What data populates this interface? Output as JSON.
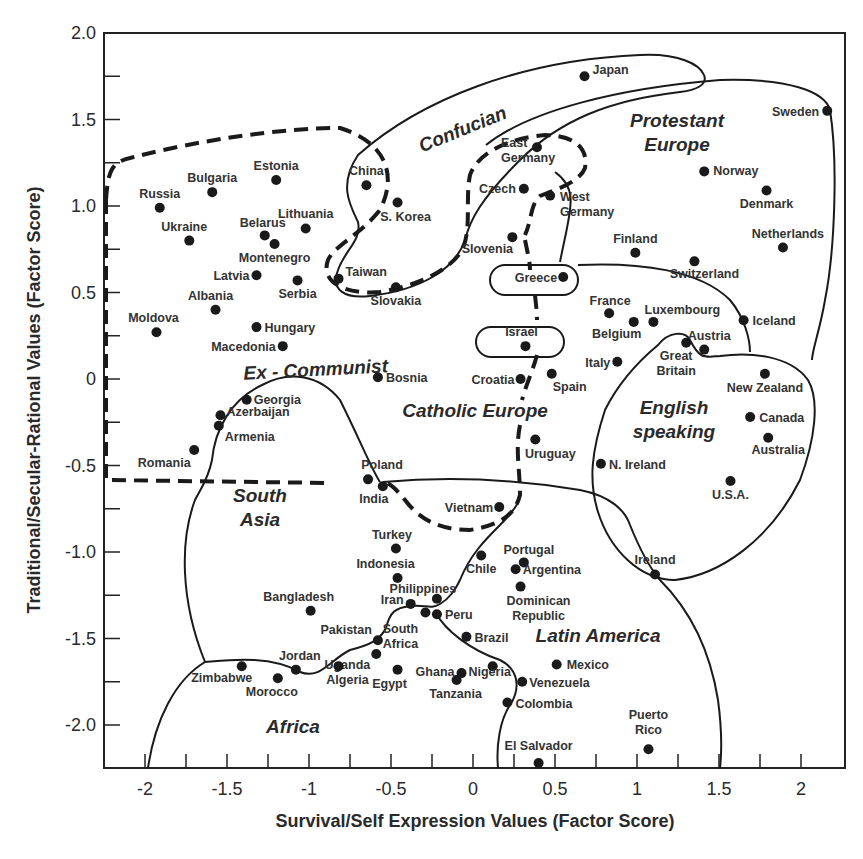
{
  "chart_data": {
    "type": "scatter",
    "title": "",
    "xlabel": "Survival/Self Expression Values (Factor Score)",
    "ylabel": "Traditional/Secular-Rational Values (Factor Score)",
    "xlim": [
      -2.25,
      2.27
    ],
    "ylim": [
      -2.25,
      2.0
    ],
    "x_ticks": [
      "-2",
      "-1.5",
      "-1",
      "-0.5",
      "0",
      "0.5",
      "1",
      "1.5",
      "2"
    ],
    "x_tick_values": [
      -2,
      -1.5,
      -1,
      -0.5,
      0,
      0.5,
      1,
      1.5,
      2
    ],
    "y_ticks": [
      "2.0",
      "1.5",
      "1.0",
      "0.5",
      "0",
      "-0.5",
      "-1.0",
      "-1.5",
      "-2.0"
    ],
    "y_tick_values": [
      2.0,
      1.5,
      1.0,
      0.5,
      0,
      -0.5,
      -1.0,
      -1.5,
      -2.0
    ],
    "grid": false,
    "legend": null,
    "regions": [
      {
        "label": "Confucian",
        "style": "solid"
      },
      {
        "label": "Protestant Europe",
        "style": "solid"
      },
      {
        "label": "Ex - Communist",
        "style": "dashed"
      },
      {
        "label": "Catholic Europe",
        "style": "dashed"
      },
      {
        "label": "English speaking",
        "style": "solid"
      },
      {
        "label": "South Asia",
        "style": "solid"
      },
      {
        "label": "Latin America",
        "style": "solid"
      },
      {
        "label": "Africa",
        "style": "solid"
      }
    ],
    "points": [
      {
        "name": "Japan",
        "x": 0.68,
        "y": 1.75
      },
      {
        "name": "Sweden",
        "x": 2.16,
        "y": 1.55
      },
      {
        "name": "East Germany",
        "x": 0.39,
        "y": 1.34
      },
      {
        "name": "Norway",
        "x": 1.41,
        "y": 1.2
      },
      {
        "name": "Denmark",
        "x": 1.79,
        "y": 1.09
      },
      {
        "name": "Czech",
        "x": 0.31,
        "y": 1.1
      },
      {
        "name": "West Germany",
        "x": 0.47,
        "y": 1.06
      },
      {
        "name": "China",
        "x": -0.65,
        "y": 1.12
      },
      {
        "name": "S. Korea",
        "x": -0.46,
        "y": 1.02
      },
      {
        "name": "Estonia",
        "x": -1.2,
        "y": 1.15
      },
      {
        "name": "Bulgaria",
        "x": -1.59,
        "y": 1.08
      },
      {
        "name": "Russia",
        "x": -1.91,
        "y": 0.99
      },
      {
        "name": "Ukraine",
        "x": -1.73,
        "y": 0.8
      },
      {
        "name": "Belarus",
        "x": -1.27,
        "y": 0.83
      },
      {
        "name": "Lithuania",
        "x": -1.02,
        "y": 0.87
      },
      {
        "name": "Montenegro",
        "x": -1.21,
        "y": 0.78
      },
      {
        "name": "Latvia",
        "x": -1.32,
        "y": 0.6
      },
      {
        "name": "Serbia",
        "x": -1.07,
        "y": 0.57
      },
      {
        "name": "Taiwan",
        "x": -0.82,
        "y": 0.58
      },
      {
        "name": "Slovakia",
        "x": -0.47,
        "y": 0.53
      },
      {
        "name": "Slovenia",
        "x": 0.24,
        "y": 0.82
      },
      {
        "name": "Finland",
        "x": 0.99,
        "y": 0.73
      },
      {
        "name": "Switzerland",
        "x": 1.35,
        "y": 0.68
      },
      {
        "name": "Netherlands",
        "x": 1.89,
        "y": 0.76
      },
      {
        "name": "Greece",
        "x": 0.55,
        "y": 0.59
      },
      {
        "name": "Albania",
        "x": -1.57,
        "y": 0.4
      },
      {
        "name": "Moldova",
        "x": -1.93,
        "y": 0.27
      },
      {
        "name": "Hungary",
        "x": -1.32,
        "y": 0.3
      },
      {
        "name": "Macedonia",
        "x": -1.16,
        "y": 0.19
      },
      {
        "name": "France",
        "x": 0.83,
        "y": 0.38
      },
      {
        "name": "Belgium",
        "x": 0.98,
        "y": 0.33
      },
      {
        "name": "Luxembourg",
        "x": 1.1,
        "y": 0.33
      },
      {
        "name": "Iceland",
        "x": 1.65,
        "y": 0.34
      },
      {
        "name": "Austria",
        "x": 1.41,
        "y": 0.17
      },
      {
        "name": "Great Britain",
        "x": 1.3,
        "y": 0.21
      },
      {
        "name": "Israel",
        "x": 0.32,
        "y": 0.19
      },
      {
        "name": "Italy",
        "x": 0.88,
        "y": 0.1
      },
      {
        "name": "Bosnia",
        "x": -0.58,
        "y": 0.01
      },
      {
        "name": "Croatia",
        "x": 0.29,
        "y": 0.0
      },
      {
        "name": "Spain",
        "x": 0.48,
        "y": 0.03
      },
      {
        "name": "New Zealand",
        "x": 1.78,
        "y": 0.03
      },
      {
        "name": "Georgia",
        "x": -1.38,
        "y": -0.12
      },
      {
        "name": "Azerbaijan",
        "x": -1.54,
        "y": -0.21
      },
      {
        "name": "Armenia",
        "x": -1.55,
        "y": -0.27
      },
      {
        "name": "Canada",
        "x": 1.69,
        "y": -0.22
      },
      {
        "name": "Australia",
        "x": 1.8,
        "y": -0.34
      },
      {
        "name": "Uruguay",
        "x": 0.38,
        "y": -0.35
      },
      {
        "name": "Romania",
        "x": -1.7,
        "y": -0.41
      },
      {
        "name": "N. Ireland",
        "x": 0.78,
        "y": -0.49
      },
      {
        "name": "U.S.A.",
        "x": 1.57,
        "y": -0.59
      },
      {
        "name": "Poland",
        "x": -0.64,
        "y": -0.58
      },
      {
        "name": "India",
        "x": -0.55,
        "y": -0.62
      },
      {
        "name": "Vietnam",
        "x": 0.16,
        "y": -0.74
      },
      {
        "name": "Turkey",
        "x": -0.47,
        "y": -0.98
      },
      {
        "name": "Chile",
        "x": 0.05,
        "y": -1.02
      },
      {
        "name": "Portugal",
        "x": 0.31,
        "y": -1.06
      },
      {
        "name": "Argentina",
        "x": 0.26,
        "y": -1.1
      },
      {
        "name": "Indonesia",
        "x": -0.46,
        "y": -1.15
      },
      {
        "name": "Dominican Republic",
        "x": 0.29,
        "y": -1.2
      },
      {
        "name": "Ireland",
        "x": 1.11,
        "y": -1.13
      },
      {
        "name": "Bangladesh",
        "x": -0.99,
        "y": -1.34
      },
      {
        "name": "Philippines",
        "x": -0.22,
        "y": -1.27
      },
      {
        "name": "Iran",
        "x": -0.38,
        "y": -1.3
      },
      {
        "name": "South Africa",
        "x": -0.29,
        "y": -1.35
      },
      {
        "name": "Peru",
        "x": -0.22,
        "y": -1.36
      },
      {
        "name": "Brazil",
        "x": -0.04,
        "y": -1.49
      },
      {
        "name": "Pakistan",
        "x": -0.58,
        "y": -1.51
      },
      {
        "name": "Uganda",
        "x": -0.59,
        "y": -1.59
      },
      {
        "name": "Zimbabwe",
        "x": -1.41,
        "y": -1.66
      },
      {
        "name": "Jordan",
        "x": -1.08,
        "y": -1.68
      },
      {
        "name": "Algeria",
        "x": -0.82,
        "y": -1.66
      },
      {
        "name": "Egypt",
        "x": -0.46,
        "y": -1.68
      },
      {
        "name": "Ghana",
        "x": -0.07,
        "y": -1.7
      },
      {
        "name": "Tanzania",
        "x": -0.1,
        "y": -1.74
      },
      {
        "name": "Nigeria",
        "x": 0.12,
        "y": -1.66
      },
      {
        "name": "Venezuela",
        "x": 0.3,
        "y": -1.75
      },
      {
        "name": "Mexico",
        "x": 0.51,
        "y": -1.65
      },
      {
        "name": "Morocco",
        "x": -1.19,
        "y": -1.73
      },
      {
        "name": "Colombia",
        "x": 0.21,
        "y": -1.87
      },
      {
        "name": "Puerto Rico",
        "x": 1.07,
        "y": -2.14
      },
      {
        "name": "El Salvador",
        "x": 0.4,
        "y": -2.22
      }
    ]
  },
  "labels": {
    "Japan": {
      "t": [
        "Japan"
      ],
      "dx": 8,
      "dy": -2,
      "a": "start"
    },
    "Sweden": {
      "t": [
        "Sweden"
      ],
      "dx": -8,
      "dy": 5,
      "a": "end"
    },
    "East Germany": {
      "t": [
        "East",
        "Germany"
      ],
      "dx": -36,
      "dy": 0,
      "a": "start"
    },
    "Norway": {
      "t": [
        "Norway"
      ],
      "dx": 9,
      "dy": 4,
      "a": "start"
    },
    "Denmark": {
      "t": [
        "Denmark"
      ],
      "dx": 0,
      "dy": 18,
      "a": "middle"
    },
    "Czech": {
      "t": [
        "Czech"
      ],
      "dx": -8,
      "dy": 4,
      "a": "end"
    },
    "West Germany": {
      "t": [
        "West",
        "Germany"
      ],
      "dx": 10,
      "dy": 5,
      "a": "start"
    },
    "China": {
      "t": [
        "China"
      ],
      "dx": 0,
      "dy": -10,
      "a": "middle"
    },
    "S. Korea": {
      "t": [
        "S. Korea"
      ],
      "dx": 8,
      "dy": 18,
      "a": "middle"
    },
    "Estonia": {
      "t": [
        "Estonia"
      ],
      "dx": 0,
      "dy": -10,
      "a": "middle"
    },
    "Bulgaria": {
      "t": [
        "Bulgaria"
      ],
      "dx": 0,
      "dy": -10,
      "a": "middle"
    },
    "Russia": {
      "t": [
        "Russia"
      ],
      "dx": 0,
      "dy": -10,
      "a": "middle"
    },
    "Ukraine": {
      "t": [
        "Ukraine"
      ],
      "dx": -5,
      "dy": -10,
      "a": "middle"
    },
    "Belarus": {
      "t": [
        "Belarus"
      ],
      "dx": -2,
      "dy": -8,
      "a": "middle"
    },
    "Lithuania": {
      "t": [
        "Lithuania"
      ],
      "dx": 0,
      "dy": -10,
      "a": "middle"
    },
    "Montenegro": {
      "t": [
        "Montenegro"
      ],
      "dx": 0,
      "dy": 18,
      "a": "middle"
    },
    "Latvia": {
      "t": [
        "Latvia"
      ],
      "dx": -7,
      "dy": 5,
      "a": "end"
    },
    "Serbia": {
      "t": [
        "Serbia"
      ],
      "dx": 0,
      "dy": 18,
      "a": "middle"
    },
    "Taiwan": {
      "t": [
        "Taiwan"
      ],
      "dx": 7,
      "dy": -3,
      "a": "start"
    },
    "Slovakia": {
      "t": [
        "Slovakia"
      ],
      "dx": 0,
      "dy": 18,
      "a": "middle"
    },
    "Slovenia": {
      "t": [
        "Slovenia"
      ],
      "dx": -25,
      "dy": 16,
      "a": "middle"
    },
    "Finland": {
      "t": [
        "Finland"
      ],
      "dx": 0,
      "dy": -10,
      "a": "middle"
    },
    "Switzerland": {
      "t": [
        "Switzerland"
      ],
      "dx": 10,
      "dy": 17,
      "a": "middle"
    },
    "Netherlands": {
      "t": [
        "Netherlands"
      ],
      "dx": 5,
      "dy": -10,
      "a": "middle"
    },
    "Greece": {
      "t": [
        "Greece"
      ],
      "dx": -6,
      "dy": 5,
      "a": "end"
    },
    "Albania": {
      "t": [
        "Albania"
      ],
      "dx": -5,
      "dy": -10,
      "a": "middle"
    },
    "Moldova": {
      "t": [
        "Moldova"
      ],
      "dx": -3,
      "dy": -10,
      "a": "middle"
    },
    "Hungary": {
      "t": [
        "Hungary"
      ],
      "dx": 8,
      "dy": 5,
      "a": "start"
    },
    "Macedonia": {
      "t": [
        "Macedonia"
      ],
      "dx": -7,
      "dy": 5,
      "a": "end"
    },
    "France": {
      "t": [
        "France"
      ],
      "dx": 1,
      "dy": -8,
      "a": "middle"
    },
    "Belgium": {
      "t": [
        "Belgium"
      ],
      "dx": -17,
      "dy": 16,
      "a": "middle"
    },
    "Luxembourg": {
      "t": [
        "Luxembourg"
      ],
      "dx": 29,
      "dy": -8,
      "a": "middle"
    },
    "Iceland": {
      "t": [
        "Iceland"
      ],
      "dx": 9,
      "dy": 5,
      "a": "start"
    },
    "Austria": {
      "t": [
        "Austria"
      ],
      "dx": 5,
      "dy": -10,
      "a": "middle"
    },
    "Great Britain": {
      "t": [
        "Great",
        "Britain"
      ],
      "dx": -10,
      "dy": 17,
      "a": "middle"
    },
    "Israel": {
      "t": [
        "Israel"
      ],
      "dx": -4,
      "dy": -10,
      "a": "middle"
    },
    "Italy": {
      "t": [
        "Italy"
      ],
      "dx": -7,
      "dy": 5,
      "a": "end"
    },
    "Bosnia": {
      "t": [
        "Bosnia"
      ],
      "dx": 8,
      "dy": 5,
      "a": "start"
    },
    "Croatia": {
      "t": [
        "Croatia"
      ],
      "dx": -6,
      "dy": 5,
      "a": "end"
    },
    "Spain": {
      "t": [
        "Spain"
      ],
      "dx": 18,
      "dy": 17,
      "a": "middle"
    },
    "New Zealand": {
      "t": [
        "New Zealand"
      ],
      "dx": 0,
      "dy": 18,
      "a": "middle"
    },
    "Georgia": {
      "t": [
        "Georgia"
      ],
      "dx": 7,
      "dy": 4,
      "a": "start"
    },
    "Azerbaijan": {
      "t": [
        "Azerbaijan"
      ],
      "dx": 6,
      "dy": 1,
      "a": "start"
    },
    "Armenia": {
      "t": [
        "Armenia"
      ],
      "dx": 6,
      "dy": 15,
      "a": "start"
    },
    "Canada": {
      "t": [
        "Canada"
      ],
      "dx": 9,
      "dy": 5,
      "a": "start"
    },
    "Australia": {
      "t": [
        "Australia"
      ],
      "dx": 10,
      "dy": 16,
      "a": "middle"
    },
    "Uruguay": {
      "t": [
        "Uruguay"
      ],
      "dx": 15,
      "dy": 18,
      "a": "middle"
    },
    "Romania": {
      "t": [
        "Romania"
      ],
      "dx": -30,
      "dy": 17,
      "a": "middle"
    },
    "N. Ireland": {
      "t": [
        "N. Ireland"
      ],
      "dx": 8,
      "dy": 5,
      "a": "start"
    },
    "U.S.A.": {
      "t": [
        "U.S.A."
      ],
      "dx": 0,
      "dy": 18,
      "a": "middle"
    },
    "Poland": {
      "t": [
        "Poland"
      ],
      "dx": 14,
      "dy": -10,
      "a": "middle"
    },
    "India": {
      "t": [
        "India"
      ],
      "dx": -9,
      "dy": 17,
      "a": "middle"
    },
    "Vietnam": {
      "t": [
        "Vietnam"
      ],
      "dx": -6,
      "dy": 5,
      "a": "end"
    },
    "Turkey": {
      "t": [
        "Turkey"
      ],
      "dx": -4,
      "dy": -10,
      "a": "middle"
    },
    "Chile": {
      "t": [
        "Chile"
      ],
      "dx": 0,
      "dy": 18,
      "a": "middle"
    },
    "Portugal": {
      "t": [
        "Portugal"
      ],
      "dx": 5,
      "dy": -8,
      "a": "middle"
    },
    "Argentina": {
      "t": [
        "Argentina"
      ],
      "dx": 7,
      "dy": 5,
      "a": "start"
    },
    "Indonesia": {
      "t": [
        "Indonesia"
      ],
      "dx": -12,
      "dy": -10,
      "a": "middle"
    },
    "Dominican Republic": {
      "t": [
        "Dominican",
        "Republic"
      ],
      "dx": 18,
      "dy": 18,
      "a": "middle"
    },
    "Ireland": {
      "t": [
        "Ireland"
      ],
      "dx": 0,
      "dy": -10,
      "a": "middle"
    },
    "Bangladesh": {
      "t": [
        "Bangladesh"
      ],
      "dx": -12,
      "dy": -10,
      "a": "middle"
    },
    "Philippines": {
      "t": [
        "Philippines"
      ],
      "dx": -14,
      "dy": -6,
      "a": "middle"
    },
    "Iran": {
      "t": [
        "Iran"
      ],
      "dx": -7,
      "dy": 0,
      "a": "end"
    },
    "South Africa": {
      "t": [
        "South",
        "Africa"
      ],
      "dx": -25,
      "dy": 20,
      "a": "middle"
    },
    "Peru": {
      "t": [
        "Peru"
      ],
      "dx": 8,
      "dy": 5,
      "a": "start"
    },
    "Brazil": {
      "t": [
        "Brazil"
      ],
      "dx": 8,
      "dy": 5,
      "a": "start"
    },
    "Pakistan": {
      "t": [
        "Pakistan"
      ],
      "dx": -6,
      "dy": -6,
      "a": "end"
    },
    "Uganda": {
      "t": [
        "Uganda"
      ],
      "dx": -6,
      "dy": 15,
      "a": "end"
    },
    "Zimbabwe": {
      "t": [
        "Zimbabwe"
      ],
      "dx": -20,
      "dy": 16,
      "a": "middle"
    },
    "Jordan": {
      "t": [
        "Jordan"
      ],
      "dx": 4,
      "dy": -10,
      "a": "middle"
    },
    "Algeria": {
      "t": [
        "Algeria"
      ],
      "dx": 9,
      "dy": 18,
      "a": "middle"
    },
    "Egypt": {
      "t": [
        "Egypt"
      ],
      "dx": -8,
      "dy": 18,
      "a": "middle"
    },
    "Ghana": {
      "t": [
        "Ghana"
      ],
      "dx": -7,
      "dy": 3,
      "a": "end"
    },
    "Tanzania": {
      "t": [
        "Tanzania"
      ],
      "dx": -1,
      "dy": 18,
      "a": "middle"
    },
    "Nigeria": {
      "t": [
        "Nigeria"
      ],
      "dx": -3,
      "dy": 10,
      "a": "middle"
    },
    "Venezuela": {
      "t": [
        "Venezuela"
      ],
      "dx": 7,
      "dy": 5,
      "a": "start"
    },
    "Mexico": {
      "t": [
        "Mexico"
      ],
      "dx": 10,
      "dy": 5,
      "a": "start"
    },
    "Morocco": {
      "t": [
        "Morocco"
      ],
      "dx": -6,
      "dy": 18,
      "a": "middle"
    },
    "Colombia": {
      "t": [
        "Colombia"
      ],
      "dx": 8,
      "dy": 5,
      "a": "start"
    },
    "Puerto Rico": {
      "t": [
        "Puerto",
        "Rico"
      ],
      "dx": 0,
      "dy": -30,
      "a": "middle"
    },
    "El Salvador": {
      "t": [
        "El Salvador"
      ],
      "dx": 0,
      "dy": -13,
      "a": "middle"
    }
  },
  "region_labels": [
    {
      "lines": [
        "Confucian"
      ],
      "x": 465,
      "y": 135,
      "rotate": -22
    },
    {
      "lines": [
        "Protestant",
        "Europe"
      ],
      "x": 677,
      "y": 127,
      "rotate": 0
    },
    {
      "lines": [
        "Ex - Communist"
      ],
      "x": 316,
      "y": 376,
      "rotate": -3
    },
    {
      "lines": [
        "Catholic  Europe"
      ],
      "x": 475,
      "y": 417,
      "rotate": 0
    },
    {
      "lines": [
        "English",
        "speaking"
      ],
      "x": 674,
      "y": 414,
      "rotate": 0
    },
    {
      "lines": [
        "South",
        "Asia"
      ],
      "x": 260,
      "y": 502,
      "rotate": 0
    },
    {
      "lines": [
        "Latin America"
      ],
      "x": 598,
      "y": 642,
      "rotate": 0
    },
    {
      "lines": [
        "Africa"
      ],
      "x": 293,
      "y": 733,
      "rotate": 0
    }
  ]
}
